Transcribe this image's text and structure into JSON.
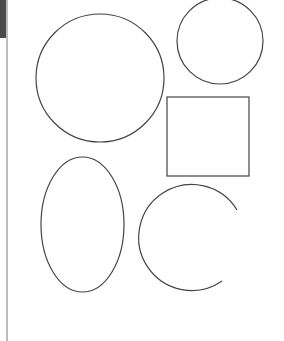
{
  "canvas": {
    "width": 284,
    "height": 341,
    "background": "#ffffff",
    "stroke_color": "#444444",
    "stroke_width": 1.2
  },
  "sidebar": {
    "thumb_color": "#4a4a4a",
    "rule_color": "#bdbdbd"
  },
  "shapes": [
    {
      "type": "circle",
      "name": "large-circle",
      "cx": 100,
      "cy": 78,
      "r": 64
    },
    {
      "type": "circle",
      "name": "small-circle",
      "cx": 220,
      "cy": 41,
      "r": 43
    },
    {
      "type": "rect",
      "name": "square",
      "x": 167,
      "y": 97,
      "width": 82,
      "height": 79
    },
    {
      "type": "ellipse",
      "name": "ellipse",
      "cx": 82.5,
      "cy": 224.5,
      "rx": 41.5,
      "ry": 67.5
    },
    {
      "type": "arc",
      "name": "open-arc",
      "cx": 193,
      "cy": 237,
      "r": 53,
      "start": [
        237,
        210
      ],
      "end": [
        222,
        281
      ]
    }
  ]
}
